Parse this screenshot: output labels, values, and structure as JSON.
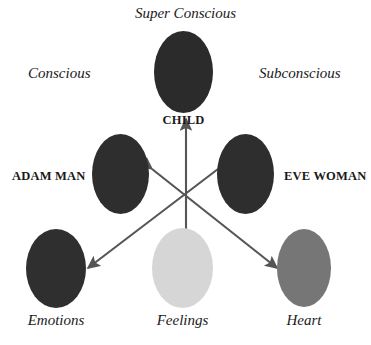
{
  "diagram": {
    "title_label": "Super Conscious",
    "left_label": "Conscious",
    "right_label": "Subconscious",
    "background_color": "#ffffff",
    "arrow_color": "#555555",
    "nodes": [
      {
        "id": "child",
        "label": "CHILD",
        "label_style": "bold",
        "color": "#2b2b2b"
      },
      {
        "id": "adam_man",
        "label": "ADAM MAN",
        "label_style": "bold",
        "color": "#2e2e2e"
      },
      {
        "id": "eve_woman",
        "label": "EVE WOMAN",
        "label_style": "bold",
        "color": "#2e2e2e"
      },
      {
        "id": "emotions",
        "label": "Emotions",
        "label_style": "italic",
        "color": "#2f2f2f"
      },
      {
        "id": "feelings",
        "label": "Feelings",
        "label_style": "italic",
        "color": "#d6d6d6"
      },
      {
        "id": "heart",
        "label": "Heart",
        "label_style": "italic",
        "color": "#767676"
      }
    ],
    "arrows": [
      {
        "name": "child-feelings-axis",
        "from": "feelings-center",
        "to": "child",
        "double_headed": true
      },
      {
        "name": "adam-man-heart-axis",
        "from": "adam_man",
        "to": "heart",
        "double_headed": true
      },
      {
        "name": "eve-woman-emotions-axis",
        "from": "eve_woman",
        "to": "emotions",
        "double_headed": true
      }
    ],
    "bottom_caption": ""
  }
}
